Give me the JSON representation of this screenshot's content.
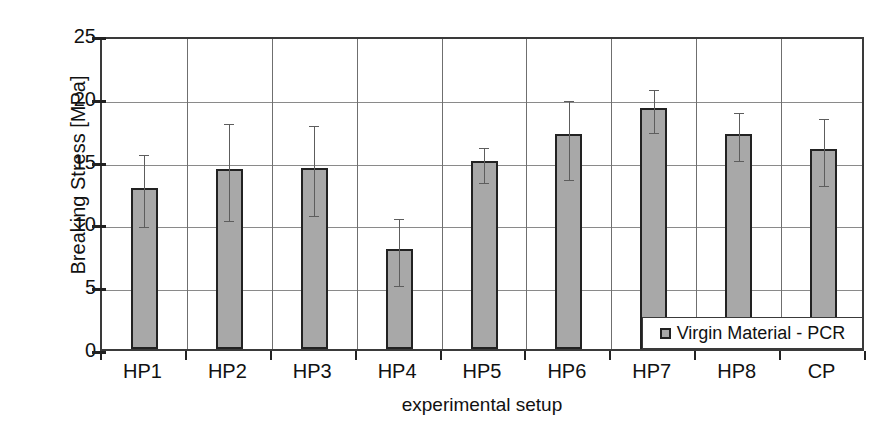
{
  "chart_data": {
    "type": "bar",
    "title": "",
    "xlabel": "experimental setup",
    "ylabel": "Breaking Stress  [MPa]",
    "ylim": [
      0,
      25
    ],
    "yticks": [
      0,
      5,
      10,
      15,
      20,
      25
    ],
    "grid": true,
    "legend_position": "bottom-right",
    "legend": [
      "Virgin Material - PCR"
    ],
    "categories": [
      "HP1",
      "HP2",
      "HP3",
      "HP4",
      "HP5",
      "HP6",
      "HP7",
      "HP8",
      "CP"
    ],
    "series": [
      {
        "name": "Virgin Material - PCR",
        "values": [
          12.8,
          14.3,
          14.4,
          8.0,
          15.0,
          17.1,
          19.2,
          17.1,
          15.9
        ],
        "error_low": [
          10.0,
          10.5,
          10.9,
          5.3,
          13.5,
          13.8,
          17.5,
          15.3,
          13.3
        ],
        "error_high": [
          15.8,
          18.2,
          18.1,
          10.7,
          16.3,
          20.1,
          20.9,
          19.1,
          18.6
        ]
      }
    ]
  },
  "axes": {
    "y_title": "Breaking Stress  [MPa]",
    "x_title": "experimental setup",
    "y_tick_labels": [
      "25",
      "20",
      "15",
      "10",
      "5",
      "0"
    ]
  },
  "legend": {
    "label": "Virgin Material - PCR",
    "swatch_color": "#a8a8a8"
  },
  "style": {
    "bar_fill": "#a8a8a8",
    "bar_stroke": "#222222",
    "grid_color": "#8a8a8a",
    "axis_color": "#3a3a3a",
    "error_color": "#5d5d5d"
  }
}
